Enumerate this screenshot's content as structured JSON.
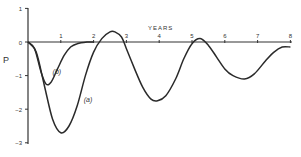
{
  "chart_data": {
    "type": "line",
    "title": "",
    "xlabel": "YEARS",
    "ylabel": "P",
    "xlim": [
      0,
      8
    ],
    "ylim": [
      -3,
      1
    ],
    "x_ticks": [
      "1",
      "2",
      "3",
      "4",
      "5",
      "6",
      "7",
      "8"
    ],
    "y_ticks": [
      "1",
      "0",
      "-1",
      "-2",
      "-3"
    ],
    "grid": false,
    "legend": "inline labels",
    "series": [
      {
        "name": "(a)",
        "x": [
          0,
          0.25,
          0.5,
          0.75,
          1.0,
          1.25,
          1.5,
          1.75,
          2.0,
          2.25,
          2.5,
          2.65,
          2.85,
          3.0,
          3.25,
          3.5,
          3.75,
          3.95,
          4.2,
          4.5,
          4.75,
          5.0,
          5.25,
          5.5,
          5.75,
          6.0,
          6.25,
          6.6,
          6.9,
          7.25,
          7.5,
          7.75,
          8.0
        ],
        "values": [
          0,
          -0.3,
          -1.3,
          -2.3,
          -2.7,
          -2.5,
          -1.9,
          -1.0,
          -0.3,
          0.1,
          0.3,
          0.3,
          0.15,
          -0.2,
          -0.8,
          -1.35,
          -1.7,
          -1.75,
          -1.6,
          -1.1,
          -0.5,
          -0.05,
          0.1,
          -0.1,
          -0.45,
          -0.8,
          -1.0,
          -1.1,
          -0.95,
          -0.55,
          -0.3,
          -0.15,
          -0.15
        ]
      },
      {
        "name": "(b)",
        "x": [
          0,
          0.2,
          0.4,
          0.55,
          0.7,
          0.9,
          1.1,
          1.3,
          1.5,
          1.8,
          2.0
        ],
        "values": [
          0,
          -0.2,
          -0.9,
          -1.25,
          -1.2,
          -0.8,
          -0.4,
          -0.15,
          -0.05,
          0,
          0
        ]
      }
    ],
    "annotations": [
      {
        "text": "(a)",
        "x": 1.7,
        "y": -1.8
      },
      {
        "text": "(b)",
        "x": 0.75,
        "y": -0.95
      }
    ]
  }
}
